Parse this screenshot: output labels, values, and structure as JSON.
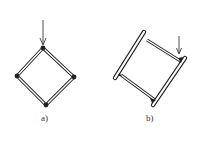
{
  "figures": [
    {
      "id": "a",
      "label": "a)",
      "description": "Square frame rotated 45° with rigid (filled) joints, loaded by a vertical force at the top vertex"
    },
    {
      "id": "b",
      "label": "b)",
      "description": "Deformed square frame with two bars connected by two links, loaded by a vertical force at the right joint"
    }
  ],
  "colors": {
    "stroke": "#222222",
    "background": "#ffffff"
  }
}
